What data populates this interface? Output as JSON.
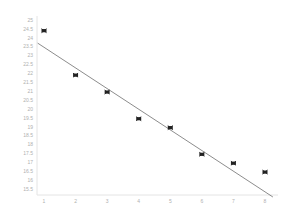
{
  "chart_data": {
    "type": "scatter",
    "title": "",
    "xlabel": "",
    "ylabel": "",
    "x": [
      1,
      2,
      3,
      4,
      5,
      6,
      7,
      8
    ],
    "series": [
      {
        "name": "data",
        "kind": "scatter",
        "marker": "x",
        "values": [
          24.4,
          21.9,
          20.95,
          19.45,
          18.95,
          17.45,
          16.95,
          16.45
        ]
      },
      {
        "name": "linear fit",
        "kind": "line",
        "points": [
          [
            0.8,
            23.7
          ],
          [
            8.25,
            15.05
          ]
        ]
      }
    ],
    "xticks": [
      "1",
      "2",
      "3",
      "4",
      "5",
      "6",
      "7",
      "8"
    ],
    "yticks": [
      "25",
      "24.5",
      "24",
      "23.5",
      "23",
      "22.5",
      "22",
      "21.5",
      "21",
      "20.5",
      "20",
      "19.5",
      "19",
      "18.5",
      "18",
      "17.5",
      "17",
      "16.5",
      "16",
      "15.5"
    ],
    "xlim": [
      0.8,
      8.3
    ],
    "ylim": [
      15.3,
      25.2
    ],
    "grid": false,
    "legend": "none",
    "colors": {
      "marker": "#222222",
      "line": "#6e6e6e",
      "axis": "#e4e4e4",
      "tick_label": "#b0b0b0"
    }
  }
}
